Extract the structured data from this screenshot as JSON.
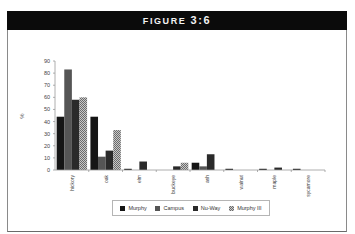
{
  "figure": {
    "title_prefix": "FIGURE",
    "title_number": "3:6"
  },
  "chart_data": {
    "type": "bar",
    "title": "FIGURE 3:6",
    "xlabel": "",
    "ylabel": "%",
    "ylim": [
      0,
      90
    ],
    "yticks": [
      0,
      10,
      20,
      30,
      40,
      50,
      60,
      70,
      80,
      90
    ],
    "grid": false,
    "legend_position": "bottom",
    "categories": [
      "hickory",
      "oak",
      "elm",
      "buckeye",
      "ash",
      "walnut",
      "maple",
      "sycamore"
    ],
    "series": [
      {
        "name": "Murphy",
        "color": "#151515",
        "pattern": "solid",
        "values": [
          44,
          44,
          1,
          0,
          6,
          1,
          1,
          1
        ]
      },
      {
        "name": "Campus",
        "color": "#555555",
        "pattern": "solid",
        "values": [
          83,
          11,
          0,
          0,
          3,
          0,
          0,
          0
        ]
      },
      {
        "name": "Nu-Way",
        "color": "#2a2a2a",
        "pattern": "solid",
        "values": [
          58,
          16,
          7,
          3,
          13,
          0,
          2,
          0
        ]
      },
      {
        "name": "Murphy III",
        "color": "#9a9a9a",
        "pattern": "checker",
        "values": [
          60,
          33,
          0,
          6,
          0,
          0,
          0,
          0
        ]
      }
    ]
  },
  "legend": {
    "items": [
      {
        "label": "Murphy",
        "color": "#151515"
      },
      {
        "label": "Campus",
        "color": "#555555"
      },
      {
        "label": "Nu-Way",
        "color": "#2a2a2a"
      },
      {
        "label": "Murphy III",
        "color": "#9a9a9a"
      }
    ]
  }
}
